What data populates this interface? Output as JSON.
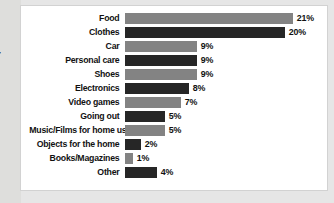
{
  "page": {
    "background_color": "#e6e6e6",
    "gutter_color": "#dededc",
    "gutter_fragment_text": "r"
  },
  "card": {
    "background_color": "#ffffff",
    "border_color": "#d2d2d2"
  },
  "chart_data": {
    "type": "bar",
    "orientation": "horizontal",
    "title": "",
    "subtitle": "",
    "xlabel": "",
    "ylabel": "",
    "grid": false,
    "legend": false,
    "value_suffix": "%",
    "xlim": [
      0,
      21
    ],
    "categories": [
      "Food",
      "Clothes",
      "Car",
      "Personal care",
      "Shoes",
      "Electronics",
      "Video games",
      "Going out",
      "Music/Films for home use",
      "Objects for the home",
      "Books/Magazines",
      "Other"
    ],
    "values": [
      21,
      20,
      9,
      9,
      9,
      8,
      7,
      5,
      5,
      2,
      1,
      4
    ],
    "value_labels": [
      "21%",
      "20%",
      "9%",
      "9%",
      "9%",
      "8%",
      "7%",
      "5%",
      "5%",
      "2%",
      "1%",
      "4%"
    ],
    "bar_colors": [
      "#838383",
      "#262626",
      "#838383",
      "#262626",
      "#838383",
      "#262626",
      "#838383",
      "#262626",
      "#838383",
      "#262626",
      "#838383",
      "#262626"
    ],
    "bar_shades": [
      "light",
      "dark",
      "light",
      "dark",
      "light",
      "dark",
      "light",
      "dark",
      "light",
      "dark",
      "light",
      "dark"
    ],
    "palette": {
      "light": "#838383",
      "dark": "#262626"
    },
    "px_per_unit": 8.0
  }
}
